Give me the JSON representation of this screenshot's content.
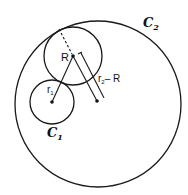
{
  "figure": {
    "circles": {
      "outer": {
        "label": "C",
        "subscript": "2",
        "cx": 98,
        "cy": 104,
        "r": 83
      },
      "middle": {
        "label": "R",
        "cx": 73,
        "cy": 56,
        "r": 29
      },
      "small": {
        "label": "C",
        "subscript": "1",
        "cx": 52,
        "cy": 102,
        "r": 22
      }
    },
    "segments": {
      "r1": {
        "label": "r",
        "subscript": "1"
      },
      "r2_minus_R": {
        "label_prefix": "r",
        "subscript": "2",
        "label_suffix": "– R"
      },
      "dashed_radius": {
        "style": "dashed"
      }
    },
    "colors": {
      "line": "#1a1a1a",
      "background": "#ffffff"
    }
  }
}
